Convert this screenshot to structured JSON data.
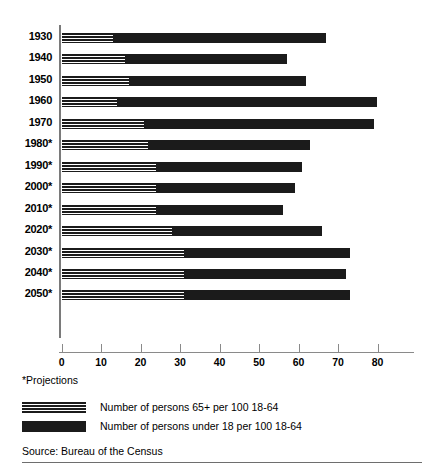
{
  "chart_data": {
    "type": "bar",
    "orientation": "horizontal",
    "stacked": true,
    "title": "",
    "subtitle": "",
    "xlabel": "",
    "ylabel": "",
    "categories": [
      "1930",
      "1940",
      "1950",
      "1960",
      "1970",
      "1980*",
      "1990*",
      "2000*",
      "2010*",
      "2020*",
      "2030*",
      "2040*",
      "2050*"
    ],
    "xticks": [
      0,
      10,
      20,
      30,
      40,
      50,
      60,
      70,
      80
    ],
    "xtick_labels": [
      "0",
      "10",
      "20",
      "30",
      "40",
      "50",
      "60",
      "70",
      "80"
    ],
    "xlim": [
      0,
      89
    ],
    "grid": false,
    "legend_position": "below-axes",
    "series": [
      {
        "name": "Number of persons 65+ per 100 18-64",
        "style": "striped",
        "values": [
          13,
          16,
          17,
          14,
          21,
          22,
          24,
          24,
          24,
          28,
          31,
          31,
          31
        ]
      },
      {
        "name": "Number of persons under 18 per 100 18-64",
        "style": "solid",
        "values": [
          54,
          41,
          45,
          66,
          58,
          41,
          37,
          35,
          32,
          38,
          42,
          41,
          42
        ]
      }
    ],
    "totals": [
      67,
      57,
      62,
      80,
      79,
      63,
      61,
      59,
      56,
      66,
      73,
      72,
      73
    ],
    "annotations": {
      "footnote": "*Projections",
      "source": "Source: Bureau of the Census"
    }
  },
  "axis": {
    "tick_labels": [
      "0",
      "10",
      "20",
      "30",
      "40",
      "50",
      "60",
      "70",
      "80"
    ]
  },
  "legend": {
    "items": [
      {
        "label": "Number of persons 65+ per 100 18-64",
        "swatch": "striped-swatch"
      },
      {
        "label": "Number of persons under 18 per 100 18-64",
        "swatch": "solid-swatch"
      }
    ]
  },
  "footnote": "*Projections",
  "source": "Source: Bureau of the Census",
  "colors": {
    "bar": "#1b1b1b",
    "axis": "#7a7a7a",
    "background": "#ffffff"
  }
}
